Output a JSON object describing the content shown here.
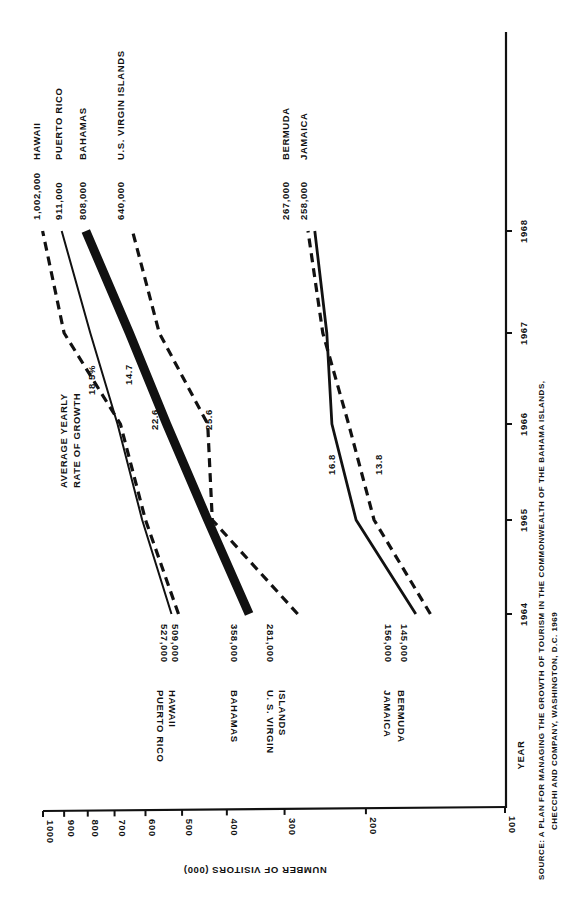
{
  "chart_data": {
    "type": "line",
    "orientation": "rotated-90-clockwise",
    "title": "",
    "xlabel": "YEAR",
    "ylabel": "NUMBER OF VISITORS (000)",
    "yscale": "log",
    "ylim": [
      100,
      1000
    ],
    "x": [
      1964,
      1965,
      1966,
      1967,
      1968
    ],
    "x_tick_labels": [
      "1964",
      "1965",
      "1966",
      "1967",
      "1968"
    ],
    "y_tick_labels": [
      "1000",
      "900",
      "800",
      "700",
      "600",
      "500",
      "400",
      "300",
      "200",
      "100"
    ],
    "y_ticks": [
      1000,
      900,
      800,
      700,
      600,
      500,
      400,
      300,
      200,
      100
    ],
    "growth_header": [
      "AVERAGE YEARLY",
      "RATE OF GROWTH"
    ],
    "series": [
      {
        "name": "HAWAII",
        "style": "dashed",
        "values": [
          509,
          600,
          680,
          900,
          1002
        ],
        "start_label": "509,000",
        "end_label": "1,002,000",
        "growth_rate": "18.5%"
      },
      {
        "name": "PUERTO RICO",
        "style": "solid-thin",
        "values": [
          527,
          610,
          690,
          790,
          911
        ],
        "start_label": "527,000",
        "end_label": "911,000",
        "growth_rate": "14.7"
      },
      {
        "name": "BAHAMAS",
        "style": "solid-thick",
        "values": [
          358,
          440,
          540,
          650,
          808
        ],
        "start_label": "358,000",
        "end_label": "808,000",
        "growth_rate": "22.6"
      },
      {
        "name": "U.S. VIRGIN ISLANDS",
        "style": "dashed",
        "values": [
          281,
          430,
          440,
          560,
          640
        ],
        "start_label": "281,000",
        "end_label": "640,000",
        "growth_rate": "25.6"
      },
      {
        "name": "JAMAICA",
        "style": "solid",
        "values": [
          156,
          210,
          237,
          243,
          258
        ],
        "start_label": "156,000",
        "end_label": "258,000",
        "growth_rate": "16.8"
      },
      {
        "name": "BERMUDA",
        "style": "dashed",
        "values": [
          145,
          192,
          218,
          248,
          267
        ],
        "start_label": "145,000",
        "end_label": "267,000",
        "growth_rate": "13.8"
      }
    ],
    "start_name_labels": [
      {
        "lines": [
          "PUERTO RICO",
          "HAWAII"
        ]
      },
      {
        "lines": [
          "BAHAMAS"
        ]
      },
      {
        "lines": [
          "U. S. VIRGIN",
          "ISLANDS"
        ]
      },
      {
        "lines": [
          "JAMAICA",
          "BERMUDA"
        ]
      }
    ],
    "end_name_labels": [
      "HAWAII",
      "PUERTO RICO",
      "BAHAMAS",
      "U.S. VIRGIN ISLANDS",
      "BERMUDA",
      "JAMAICA"
    ],
    "source": [
      "SOURCE:  A PLAN FOR MANAGING THE GROWTH OF TOURISM IN THE COMMONWEALTH OF THE BAHAMA ISLANDS,",
      "CHECCHI AND COMPANY, WASHINGTON, D.C. 1969"
    ],
    "grid": false,
    "legend": "direct labels"
  }
}
